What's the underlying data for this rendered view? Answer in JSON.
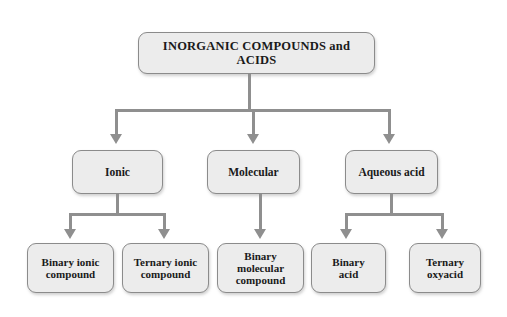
{
  "diagram": {
    "title_node": {
      "label": "INORGANIC COMPOUNDS and ACIDS"
    },
    "level2": [
      {
        "label": "Ionic"
      },
      {
        "label": "Molecular"
      },
      {
        "label": "Aqueous acid"
      }
    ],
    "level3": [
      {
        "line1": "Binary ionic",
        "line2": "compound",
        "line3": ""
      },
      {
        "line1": "Ternary ionic",
        "line2": "compound",
        "line3": ""
      },
      {
        "line1": "Binary",
        "line2": "molecular",
        "line3": "compound"
      },
      {
        "line1": "Binary",
        "line2": "acid",
        "line3": ""
      },
      {
        "line1": "Ternary",
        "line2": "oxyacid",
        "line3": ""
      }
    ],
    "colors": {
      "node_fill": "#ececec",
      "node_border": "#8b8b8b",
      "connector": "#8f8f8f",
      "background": "#ffffff",
      "text": "#1a1a1a"
    }
  }
}
